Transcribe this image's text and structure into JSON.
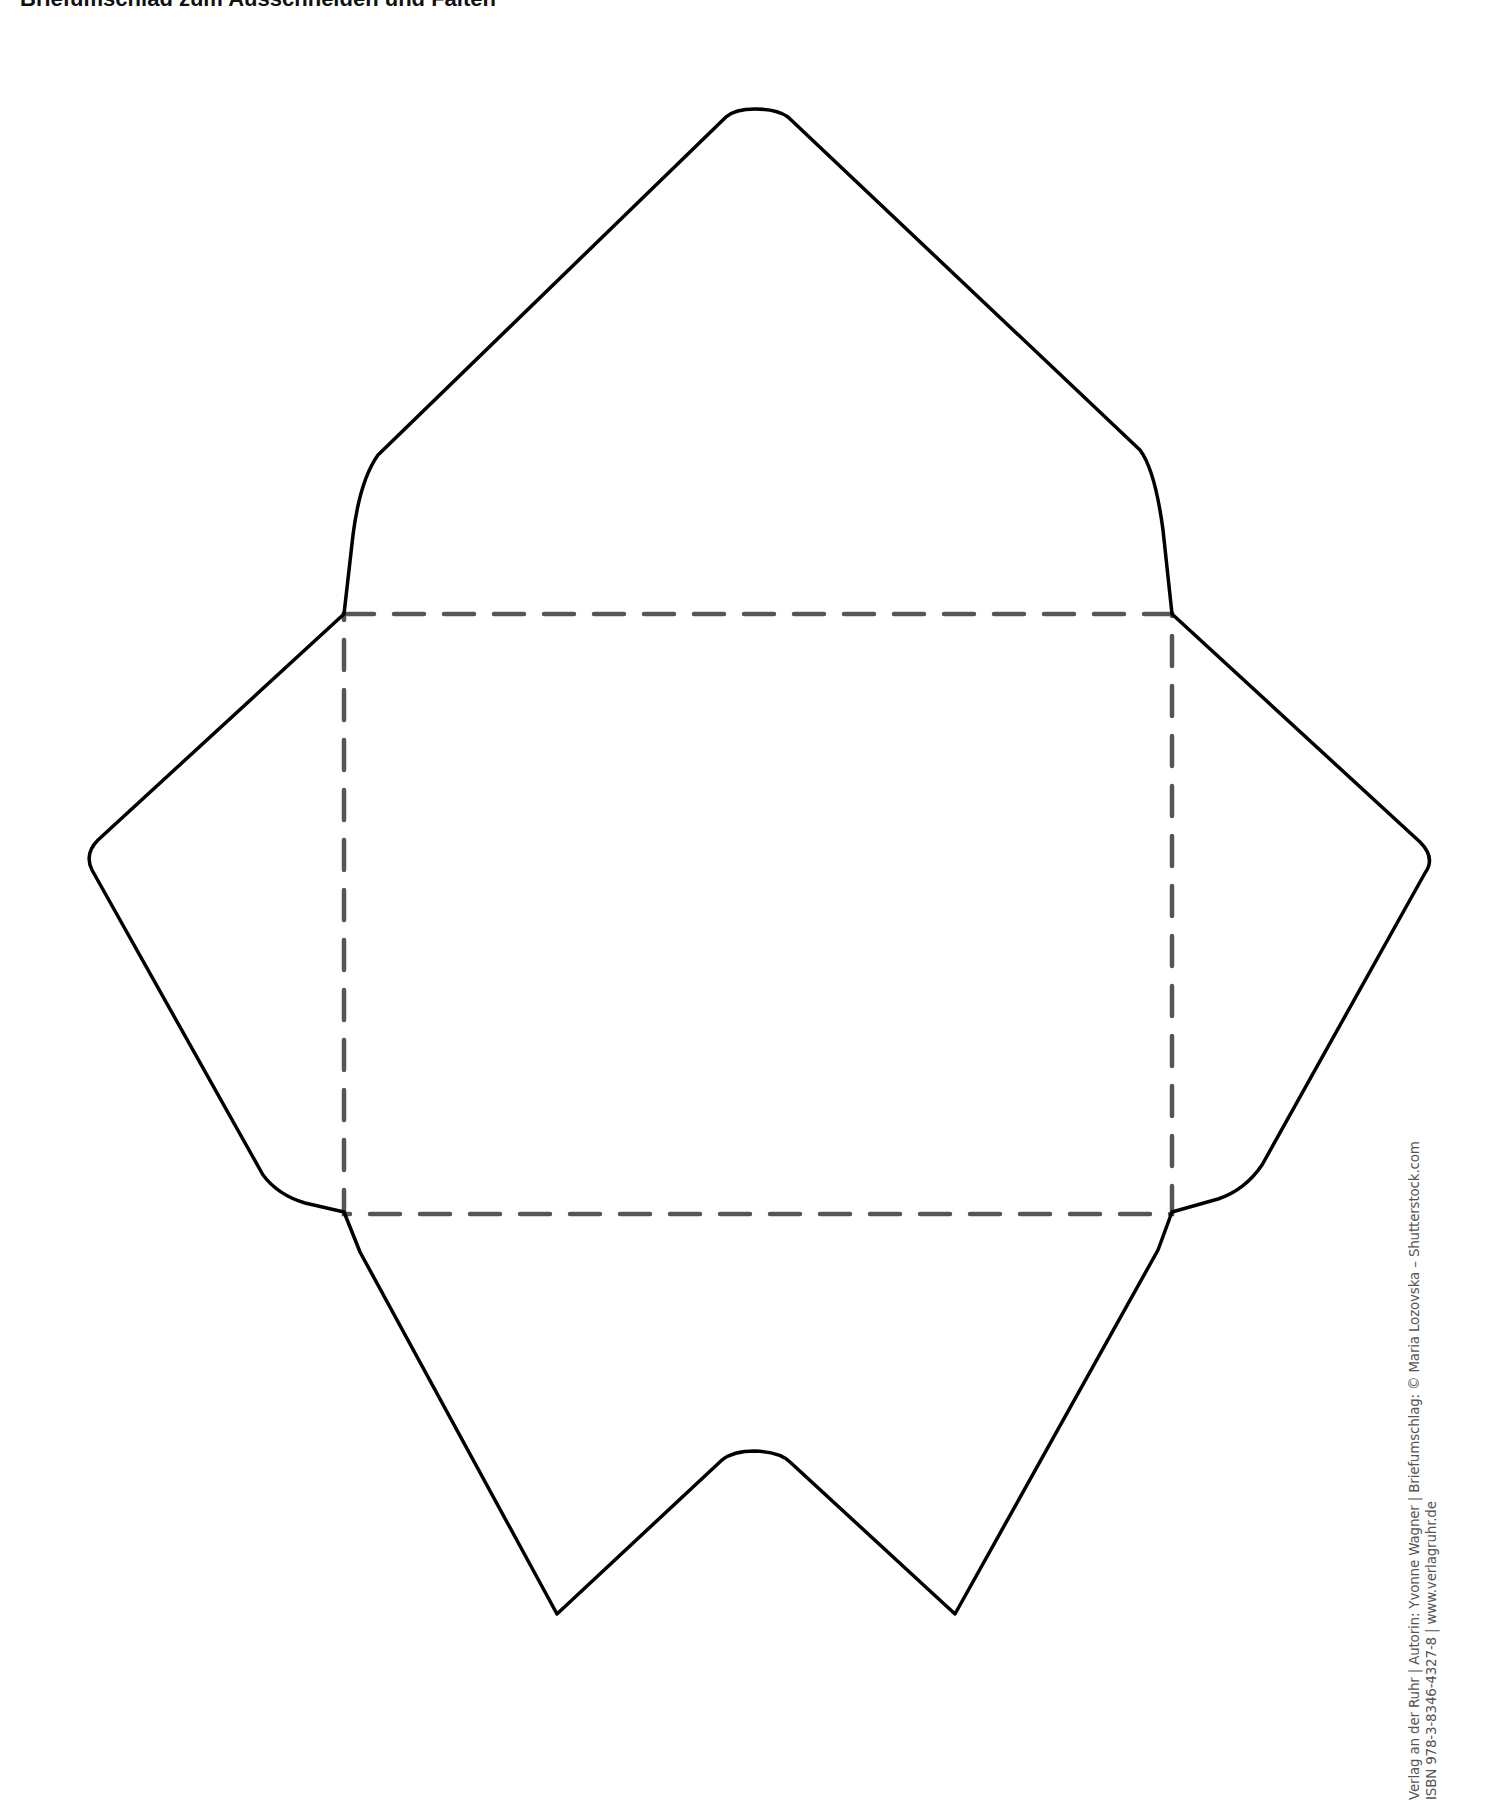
{
  "page": {
    "title_fragment": "Briefumschlag zum Ausschneiden und Falten",
    "template": {
      "name": "Briefumschlag",
      "outline_color": "#000000",
      "fold_line_color": "#555555",
      "outline_label": "cut-line",
      "fold_label": "fold-line"
    },
    "credit": {
      "line1": "Verlag an der Ruhr | Autorin: Yvonne Wagner | Briefumschlag: © Maria Lozovska – Shutterstock.com",
      "line2": "ISBN 978-3-8346-4327-8 | www.verlagruhr.de"
    }
  }
}
